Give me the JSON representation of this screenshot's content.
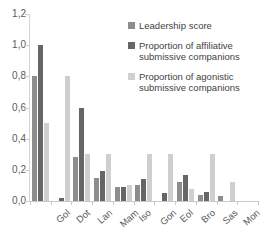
{
  "chart_data": {
    "type": "bar",
    "title": "",
    "xlabel": "",
    "ylabel": "",
    "ylim": [
      0,
      1.2
    ],
    "grid": false,
    "legend_position": "top-right",
    "decimal_separator": ",",
    "categories": [
      "Gol",
      "Dot",
      "Lan",
      "Mam",
      "Iso",
      "Gon",
      "Eol",
      "Bro",
      "Sas",
      "Mon",
      "Mag"
    ],
    "ytick_labels": [
      "1,2",
      "1,0",
      "0,8",
      "0,6",
      "0,4",
      "0,2",
      "0,0"
    ],
    "ytick_values": [
      1.2,
      1.0,
      0.8,
      0.6,
      0.4,
      0.2,
      0.0
    ],
    "series": [
      {
        "name": "Leadership score",
        "color": "#8d8d8d",
        "values": [
          0.8,
          0.0,
          0.28,
          0.15,
          0.09,
          0.1,
          0.0,
          0.12,
          0.04,
          0.03,
          0.0
        ]
      },
      {
        "name": "Proportion of affiliative submissive companions",
        "color": "#666666",
        "values": [
          1.0,
          0.02,
          0.6,
          0.19,
          0.09,
          0.14,
          0.05,
          0.17,
          0.06,
          0.0,
          0.0
        ]
      },
      {
        "name": "Proportion of agonistic submissive companions",
        "color": "#cfcfcf",
        "values": [
          0.5,
          0.8,
          0.3,
          0.3,
          0.1,
          0.3,
          0.3,
          0.08,
          0.3,
          0.12,
          0.0
        ]
      }
    ]
  },
  "legend": {
    "items": [
      {
        "label": "Leadership score"
      },
      {
        "label": "Proportion of affiliative submissive companions"
      },
      {
        "label": "Proportion of agonistic submissive companions"
      }
    ]
  }
}
